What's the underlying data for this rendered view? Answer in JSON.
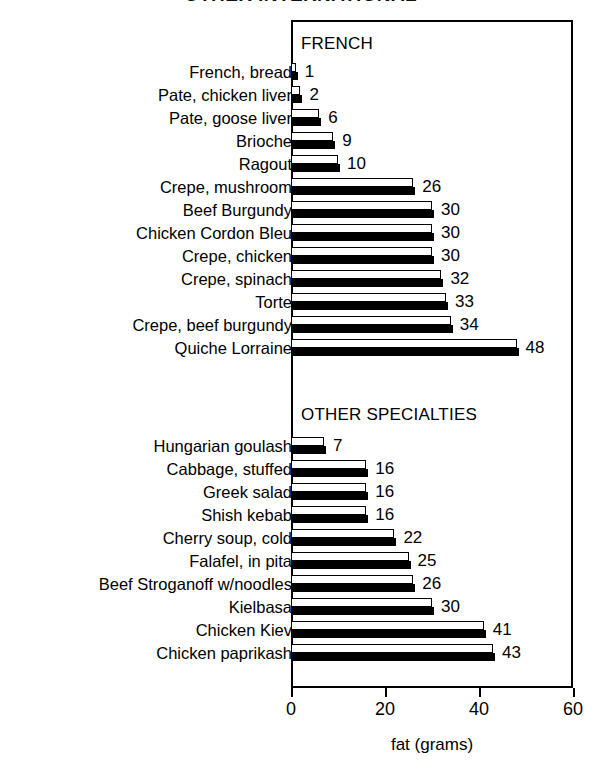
{
  "chart_data": {
    "type": "bar",
    "orientation": "horizontal",
    "title": "OTHER INTERNATIONAL",
    "xlabel": "fat (grams)",
    "ylabel": "",
    "xlim": [
      0,
      60
    ],
    "xticks": [
      0,
      20,
      40,
      60
    ],
    "xtick_labels": [
      "0",
      "20",
      "40",
      "60"
    ],
    "grid": false,
    "legend": "none",
    "groups": [
      {
        "name": "FRENCH",
        "categories": [
          "French, bread",
          "Pate, chicken liver",
          "Pate, goose liver",
          "Brioche",
          "Ragout",
          "Crepe, mushroom",
          "Beef Burgundy",
          "Chicken Cordon Bleu",
          "Crepe, chicken",
          "Crepe, spinach",
          "Torte",
          "Crepe, beef burgundy",
          "Quiche Lorraine"
        ],
        "values": [
          1,
          2,
          6,
          9,
          10,
          26,
          30,
          30,
          30,
          32,
          33,
          34,
          48
        ]
      },
      {
        "name": "OTHER SPECIALTIES",
        "categories": [
          "Hungarian goulash",
          "Cabbage, stuffed",
          "Greek salad",
          "Shish kebab",
          "Cherry soup, cold",
          "Falafel, in pita",
          "Beef Stroganoff w/noodles",
          "Kielbasa",
          "Chicken Kiev",
          "Chicken paprikash"
        ],
        "values": [
          7,
          16,
          16,
          16,
          22,
          25,
          26,
          30,
          41,
          43
        ]
      }
    ],
    "categories": [
      "French, bread",
      "Pate, chicken liver",
      "Pate, goose liver",
      "Brioche",
      "Ragout",
      "Crepe, mushroom",
      "Beef Burgundy",
      "Chicken Cordon Bleu",
      "Crepe, chicken",
      "Crepe, spinach",
      "Torte",
      "Crepe, beef burgundy",
      "Quiche Lorraine",
      "Hungarian goulash",
      "Cabbage, stuffed",
      "Greek salad",
      "Shish kebab",
      "Cherry soup, cold",
      "Falafel, in pita",
      "Beef Stroganoff w/noodles",
      "Kielbasa",
      "Chicken Kiev",
      "Chicken paprikash"
    ],
    "values": [
      1,
      2,
      6,
      9,
      10,
      26,
      30,
      30,
      30,
      32,
      33,
      34,
      48,
      7,
      16,
      16,
      16,
      22,
      25,
      26,
      30,
      41,
      43
    ],
    "colors": {
      "bar_face": "#ffffff",
      "bar_edge": "#000000",
      "bar_shadow": "#000000",
      "background": "#ffffff",
      "text": "#000000"
    }
  }
}
